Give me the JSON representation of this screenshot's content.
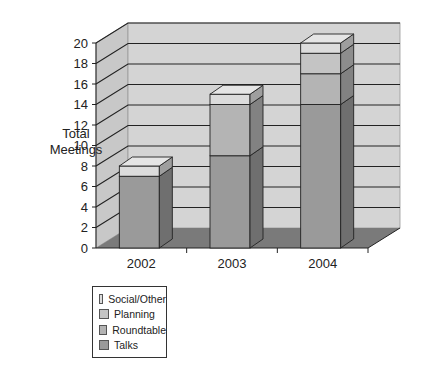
{
  "chart_data": {
    "type": "bar",
    "stacked": true,
    "three_d": true,
    "title": "",
    "xlabel": "",
    "ylabel": "Total Meetings",
    "ylim": [
      0,
      20
    ],
    "yticks": [
      0,
      2,
      4,
      6,
      8,
      10,
      12,
      14,
      16,
      18,
      20
    ],
    "grid": true,
    "legend_position": "bottom-left",
    "categories": [
      "2002",
      "2003",
      "2004"
    ],
    "series": [
      {
        "name": "Talks",
        "values": [
          7,
          9,
          14
        ],
        "color": "#9a9a9a"
      },
      {
        "name": "Roundtable",
        "values": [
          0,
          5,
          3
        ],
        "color": "#b4b4b4"
      },
      {
        "name": "Planning",
        "values": [
          0,
          0,
          2
        ],
        "color": "#c4c4c4"
      },
      {
        "name": "Social/Other",
        "values": [
          1,
          1,
          1
        ],
        "color": "#dcdcdc"
      }
    ],
    "totals": [
      8,
      15,
      20
    ]
  },
  "axis": {
    "ylabel_line1": "Total",
    "ylabel_line2": "Meetings"
  },
  "legend": {
    "items": [
      {
        "label": "Social/Other",
        "color": "#dcdcdc"
      },
      {
        "label": "Planning",
        "color": "#c4c4c4"
      },
      {
        "label": "Roundtable",
        "color": "#b4b4b4"
      },
      {
        "label": "Talks",
        "color": "#9a9a9a"
      }
    ]
  },
  "colors": {
    "back_wall": "#d4d4d4",
    "side_wall": "#c8c8c8",
    "floor": "#7a7a7a",
    "grid_line": "#222222"
  }
}
